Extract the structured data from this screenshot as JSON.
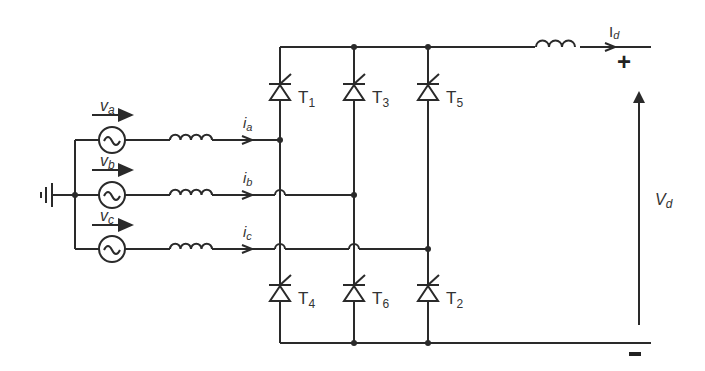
{
  "diagram": {
    "type": "three-phase thyristor bridge rectifier",
    "sources": [
      {
        "id": "va",
        "voltage_label": "v",
        "voltage_sub": "a",
        "current_label": "i",
        "current_sub": "a"
      },
      {
        "id": "vb",
        "voltage_label": "v",
        "voltage_sub": "b",
        "current_label": "i",
        "current_sub": "b"
      },
      {
        "id": "vc",
        "voltage_label": "v",
        "voltage_sub": "c",
        "current_label": "i",
        "current_sub": "c"
      }
    ],
    "thyristors_top": [
      {
        "label": "T",
        "sub": "1"
      },
      {
        "label": "T",
        "sub": "3"
      },
      {
        "label": "T",
        "sub": "5"
      }
    ],
    "thyristors_bottom": [
      {
        "label": "T",
        "sub": "4"
      },
      {
        "label": "T",
        "sub": "6"
      },
      {
        "label": "T",
        "sub": "2"
      }
    ],
    "output": {
      "current_label": "I",
      "current_sub": "d",
      "voltage_label": "V",
      "voltage_sub": "d",
      "plus": "+",
      "minus": "−"
    },
    "colors": {
      "wire": "#2a2a2a",
      "background": "#ffffff"
    }
  }
}
